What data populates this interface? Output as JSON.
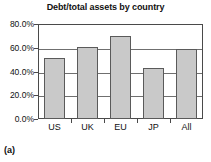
{
  "figure": {
    "caption": "(a)"
  },
  "chart_data": {
    "type": "bar",
    "title": "Debt/total assets by country",
    "xlabel": "",
    "ylabel": "",
    "categories": [
      "US",
      "UK",
      "EU",
      "JP",
      "All"
    ],
    "values": [
      0.515,
      0.605,
      0.695,
      0.43,
      0.59
    ],
    "value_labels": [
      "51.5%",
      "60.5%",
      "69.5%",
      "43.0%",
      "59.0%"
    ],
    "ylim": [
      0,
      0.8
    ],
    "ytick_values": [
      0.8,
      0.6,
      0.4,
      0.2,
      0.0
    ],
    "ytick_labels": [
      "80.0%",
      "60.0%",
      "40.0%",
      "20.0%",
      "0.0%"
    ],
    "grid": true,
    "legend": false,
    "bar_fill_color": "#c9c9c9",
    "bar_border_color": "#5a5a5a",
    "axis_color": "#4a4a4a",
    "background_color": "#ffffff"
  }
}
